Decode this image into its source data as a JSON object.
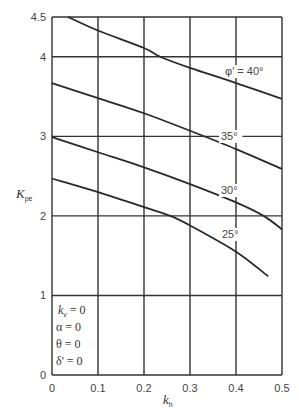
{
  "chart_data": {
    "type": "line",
    "title": "",
    "xlabel": "k_h",
    "ylabel": "K_pe",
    "xlim": [
      0,
      0.5
    ],
    "ylim": [
      0,
      4.5
    ],
    "grid": true,
    "x_ticks": [
      "0",
      "0.1",
      "0.2",
      "0.3",
      "0.4",
      "0.5"
    ],
    "y_ticks": [
      "0",
      "1",
      "2",
      "3",
      "4",
      "4.5"
    ],
    "series": [
      {
        "name": "φ' = 40°",
        "label": "φ' = 40°",
        "x": [
          0.035,
          0.1,
          0.2,
          0.235,
          0.3,
          0.4,
          0.5
        ],
        "y": [
          4.5,
          4.33,
          4.11,
          4.0,
          3.86,
          3.67,
          3.47
        ]
      },
      {
        "name": "35°",
        "label": "35°",
        "x": [
          0,
          0.1,
          0.2,
          0.3,
          0.4,
          0.5
        ],
        "y": [
          3.67,
          3.48,
          3.29,
          3.07,
          2.84,
          2.59
        ]
      },
      {
        "name": "30°",
        "label": "30°",
        "x": [
          0,
          0.1,
          0.2,
          0.3,
          0.4,
          0.46,
          0.5
        ],
        "y": [
          2.99,
          2.8,
          2.61,
          2.4,
          2.17,
          2.0,
          1.83
        ]
      },
      {
        "name": "25°",
        "label": "25°",
        "x": [
          0,
          0.1,
          0.2,
          0.257,
          0.3,
          0.4,
          0.47
        ],
        "y": [
          2.47,
          2.3,
          2.11,
          2.0,
          1.88,
          1.55,
          1.24
        ]
      }
    ],
    "annotations": [
      "k_v = 0",
      "α = 0",
      "θ = 0",
      "δ' = 0"
    ]
  },
  "labels": {
    "ylabel_main": "K",
    "ylabel_sub": "pe",
    "xlabel_main": "k",
    "xlabel_sub": "h",
    "conditions": [
      {
        "main": "k",
        "sub": "v",
        "rest": " = 0"
      },
      {
        "main": "α",
        "sub": "",
        "rest": " = 0"
      },
      {
        "main": "θ",
        "sub": "",
        "rest": " = 0"
      },
      {
        "main": "δ'",
        "sub": "",
        "rest": " = 0"
      }
    ]
  },
  "style": {
    "line_color": "#2a2a2a",
    "grid_color": "#333333",
    "text_color": "#444444"
  }
}
